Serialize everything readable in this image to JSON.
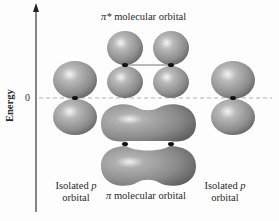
{
  "axis": {
    "label": "Energy",
    "zero_tick": "0"
  },
  "labels": {
    "pi_star": {
      "symbol": "π*",
      "text": "molecular orbital"
    },
    "pi": {
      "symbol": "π",
      "text": "molecular orbital"
    },
    "isolated_left": {
      "line1": "Isolated",
      "italic": "p",
      "line2": "orbital"
    },
    "isolated_right": {
      "line1": "Isolated",
      "italic": "p",
      "line2": "orbital"
    }
  },
  "colors": {
    "lobe_light": "#e6e6e6",
    "lobe_mid": "#9a9a9a",
    "lobe_dark": "#5e5e5e",
    "axis": "#222222",
    "dashed_line": "#999999",
    "nucleus": "#111111"
  }
}
